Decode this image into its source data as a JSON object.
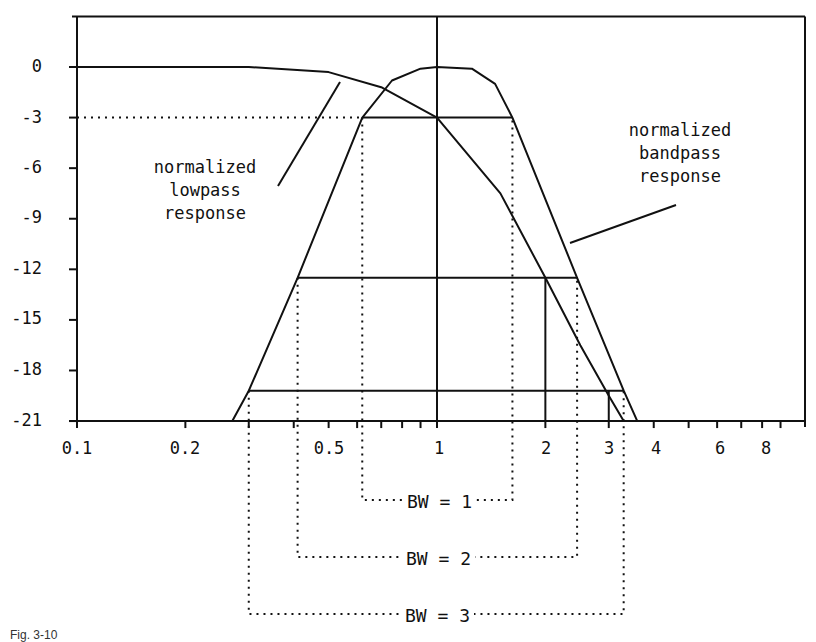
{
  "chart_data": {
    "type": "line",
    "title": "",
    "xlabel": "",
    "ylabel": "",
    "x_scale": "log",
    "xlim": [
      0.1,
      10
    ],
    "ylim": [
      -21,
      3
    ],
    "grid": false,
    "y_ticks": [
      0,
      -3,
      -6,
      -9,
      -12,
      -15,
      -18,
      -21
    ],
    "y_tick_labels": [
      "0",
      "-3",
      "-6",
      "-9",
      "-12",
      "-15",
      "-18",
      "-21"
    ],
    "x_tick_labels": [
      {
        "value": 0.1,
        "label": "0.1"
      },
      {
        "value": 0.2,
        "label": "0.2"
      },
      {
        "value": 0.5,
        "label": "0.5"
      },
      {
        "value": 1,
        "label": "1"
      },
      {
        "value": 2,
        "label": "2"
      },
      {
        "value": 3,
        "label": "3"
      },
      {
        "value": 4,
        "label": "4"
      },
      {
        "value": 6,
        "label": "6"
      },
      {
        "value": 8,
        "label": "8"
      }
    ],
    "series": [
      {
        "name": "normalized lowpass response",
        "x": [
          0.1,
          0.3,
          0.5,
          0.7,
          1.0,
          1.5,
          2.0,
          2.5,
          3.0,
          3.3
        ],
        "y": [
          0,
          0,
          -0.3,
          -1.2,
          -3,
          -7.5,
          -12.5,
          -16.5,
          -19.5,
          -21
        ]
      },
      {
        "name": "normalized bandpass response",
        "x": [
          0.27,
          0.3,
          0.41,
          0.62,
          0.75,
          0.9,
          1.0,
          1.25,
          1.45,
          1.62,
          2.45,
          3.3,
          3.6
        ],
        "y": [
          -21,
          -19.2,
          -12.5,
          -3,
          -0.8,
          -0.1,
          0,
          -0.1,
          -1,
          -3,
          -12.5,
          -19.2,
          -21
        ]
      }
    ],
    "reference_lines": [
      {
        "type": "dotted-horizontal",
        "y": -3,
        "label": "-3 dB"
      },
      {
        "type": "vertical",
        "x": 1
      },
      {
        "type": "vertical",
        "x": 2,
        "from": -21,
        "to": -12.5
      },
      {
        "type": "vertical",
        "x": 3,
        "from": -21,
        "to": -19.2
      },
      {
        "type": "horizontal",
        "y": -3,
        "x_from": 0.62,
        "x_to": 1.62
      },
      {
        "type": "horizontal",
        "y": -12.5,
        "x_from": 0.41,
        "x_to": 2.45
      },
      {
        "type": "horizontal",
        "y": -19.2,
        "x_from": 0.3,
        "x_to": 3.3
      }
    ],
    "bandwidth_brackets": [
      {
        "label": "BW = 1",
        "x_low": 0.62,
        "x_high": 1.62
      },
      {
        "label": "BW = 2",
        "x_low": 0.41,
        "x_high": 2.45
      },
      {
        "label": "BW = 3",
        "x_low": 0.3,
        "x_high": 3.3
      }
    ],
    "annotations": [
      {
        "text": "normalized lowpass response",
        "points_to": "lowpass curve near x=0.55"
      },
      {
        "text": "normalized bandpass response",
        "points_to": "bandpass curve upper skirt near x=2.3"
      }
    ]
  },
  "labels": {
    "y": [
      "0",
      "-3",
      "-6",
      "-9",
      "-12",
      "-15",
      "-18",
      "-21"
    ],
    "x": [
      "0.1",
      "0.2",
      "0.5",
      "1",
      "2",
      "3",
      "4",
      "6",
      "8"
    ],
    "lowpass_note": [
      "normalized",
      "lowpass",
      "response"
    ],
    "bandpass_note": [
      "normalized",
      "bandpass",
      "response"
    ],
    "bw1": "BW = 1",
    "bw2": "BW = 2",
    "bw3": "BW = 3",
    "caption": "Fig. 3-10"
  }
}
